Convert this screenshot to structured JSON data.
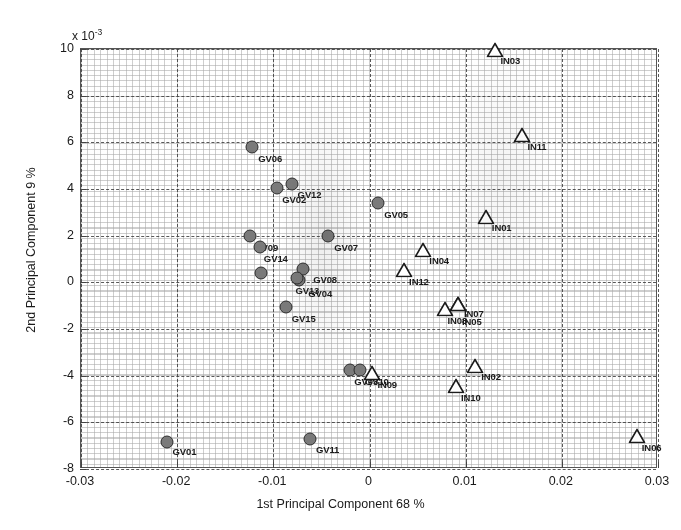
{
  "axes": {
    "x_label": "1st Principal Component  68 %",
    "y_label": "2nd Principal Component 9 %",
    "y_exponent_text": "x 10",
    "y_exponent_power": "-3",
    "x_ticks": [
      "-0.03",
      "-0.02",
      "-0.01",
      "0",
      "0.01",
      "0.02",
      "0.03"
    ],
    "y_ticks": [
      "10",
      "8",
      "6",
      "4",
      "2",
      "0",
      "-2",
      "-4",
      "-6",
      "-8"
    ]
  },
  "chart_data": {
    "type": "scatter",
    "title": "",
    "xlabel": "1st Principal Component  68 %",
    "ylabel": "2nd Principal Component 9 %",
    "y_scale_multiplier": "x 10^-3",
    "xlim": [
      -0.03,
      0.03
    ],
    "ylim": [
      -8,
      10
    ],
    "grid": "on",
    "legend": "none",
    "xticks": [
      -0.03,
      -0.02,
      -0.01,
      0,
      0.01,
      0.02,
      0.03
    ],
    "yticks": [
      10,
      8,
      6,
      4,
      2,
      0,
      -2,
      -4,
      -6,
      -8
    ],
    "series": [
      {
        "name": "GV",
        "marker": "filled-circle",
        "color": "#7a7a7a",
        "edge_color": "#2d2d2d",
        "points": [
          {
            "label": "GV01",
            "x": -0.0211,
            "y": -6.85,
            "lx": 6,
            "ly": 5
          },
          {
            "label": "GV02",
            "x": -0.0096,
            "y": 4.05,
            "lx": 5,
            "ly": 7
          },
          {
            "label": "GV03",
            "x": -0.002,
            "y": -3.75,
            "lx": 4,
            "ly": 7
          },
          {
            "label": "GV04",
            "x": -0.0073,
            "y": 0.1,
            "lx": 9,
            "ly": 9
          },
          {
            "label": "GV05",
            "x": 0.0009,
            "y": 3.42,
            "lx": 6,
            "ly": 7
          },
          {
            "label": "GV06",
            "x": -0.0122,
            "y": 5.8,
            "lx": 6,
            "ly": 7
          },
          {
            "label": "GV07",
            "x": -0.0043,
            "y": 2.0,
            "lx": 6,
            "ly": 7
          },
          {
            "label": "GV08",
            "x": -0.0069,
            "y": 0.58,
            "lx": 10,
            "ly": 6
          },
          {
            "label": "GV09",
            "x": -0.0124,
            "y": 2.0,
            "lx": 4,
            "ly": 7
          },
          {
            "label": "GV10",
            "x": -0.001,
            "y": -3.77,
            "lx": 5,
            "ly": 7
          },
          {
            "label": "GV11",
            "x": -0.0062,
            "y": -6.72,
            "lx": 6,
            "ly": 6
          },
          {
            "label": "GV12",
            "x": -0.0081,
            "y": 4.23,
            "lx": 6,
            "ly": 6
          },
          {
            "label": "GV13",
            "x": -0.0075,
            "y": 0.17,
            "lx": -2,
            "ly": 8
          },
          {
            "label": "GV14",
            "x": -0.0114,
            "y": 1.52,
            "lx": 4,
            "ly": 7
          },
          {
            "label": "GV15",
            "x": -0.0087,
            "y": -1.05,
            "lx": 6,
            "ly": 7
          },
          {
            "label": "GV_x",
            "x": -0.0113,
            "y": 0.38,
            "lx": 3,
            "ly": 8
          }
        ]
      },
      {
        "name": "IN",
        "marker": "open-triangle",
        "color": "#ffffff",
        "edge_color": "#1b1b1b",
        "points": [
          {
            "label": "IN01",
            "x": 0.0121,
            "y": 2.82,
            "lx": 6,
            "ly": 6
          },
          {
            "label": "IN02",
            "x": 0.011,
            "y": -3.6,
            "lx": 6,
            "ly": 6
          },
          {
            "label": "IN03",
            "x": 0.013,
            "y": 9.95,
            "lx": 6,
            "ly": 6
          },
          {
            "label": "IN04",
            "x": 0.0056,
            "y": 1.4,
            "lx": 6,
            "ly": 6
          },
          {
            "label": "IN05",
            "x": 0.0092,
            "y": -0.92,
            "lx": 4,
            "ly": 13
          },
          {
            "label": "IN06",
            "x": 0.0278,
            "y": -6.6,
            "lx": 5,
            "ly": 7
          },
          {
            "label": "IN07",
            "x": 0.0092,
            "y": -0.92,
            "lx": 6,
            "ly": 5
          },
          {
            "label": "IN08",
            "x": 0.0079,
            "y": -1.15,
            "lx": 2,
            "ly": 7
          },
          {
            "label": "IN09",
            "x": 0.0003,
            "y": -3.9,
            "lx": 5,
            "ly": 7
          },
          {
            "label": "IN10",
            "x": 0.009,
            "y": -4.45,
            "lx": 5,
            "ly": 7
          },
          {
            "label": "IN11",
            "x": 0.0159,
            "y": 6.32,
            "lx": 5,
            "ly": 7
          },
          {
            "label": "IN12",
            "x": 0.0036,
            "y": 0.52,
            "lx": 5,
            "ly": 7
          }
        ]
      }
    ]
  }
}
